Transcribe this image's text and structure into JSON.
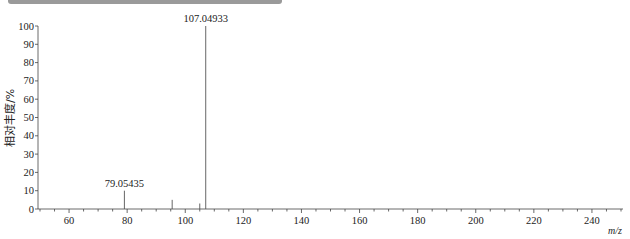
{
  "chart_data": {
    "type": "bar",
    "subtype": "mass-spectrum-stick",
    "title": "",
    "xlabel": "m/z",
    "ylabel": "相对丰度/%",
    "xlim": [
      50,
      250
    ],
    "ylim": [
      0,
      100
    ],
    "x_ticks": [
      60,
      80,
      100,
      120,
      140,
      160,
      180,
      200,
      220,
      240
    ],
    "y_ticks": [
      0,
      10,
      20,
      30,
      40,
      50,
      60,
      70,
      80,
      90,
      100
    ],
    "grid": false,
    "legend": null,
    "peaks": [
      {
        "mz": 79.05435,
        "intensity": 10,
        "label": "79.05435"
      },
      {
        "mz": 95.5,
        "intensity": 5,
        "label": ""
      },
      {
        "mz": 105.0,
        "intensity": 3,
        "label": ""
      },
      {
        "mz": 107.04933,
        "intensity": 100,
        "label": "107.04933"
      }
    ]
  },
  "labels": {
    "xlabel": "m/z",
    "ylabel": "相对丰度/%"
  }
}
